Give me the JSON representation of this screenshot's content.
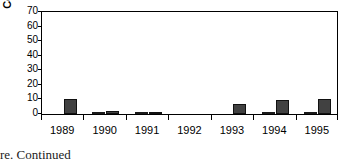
{
  "figure": {
    "caption": "re. Continued"
  },
  "chart_data": {
    "type": "bar",
    "title": "",
    "xlabel": "",
    "ylabel": "Cover (%)",
    "ylim": [
      0,
      70
    ],
    "ytick_values": [
      0,
      10,
      20,
      30,
      40,
      50,
      60,
      70
    ],
    "ytick_labels": [
      "0",
      "10",
      "20",
      "30",
      "40",
      "50",
      "60",
      "70"
    ],
    "grid": false,
    "legend": "none",
    "categories": [
      "1989",
      "1990",
      "1991",
      "1992",
      "1993",
      "1994",
      "1995"
    ],
    "series": [
      {
        "name": "series-light",
        "color": "#ffffff",
        "values": [
          0,
          1.5,
          0.7,
          0,
          0,
          0.5,
          1.0
        ]
      },
      {
        "name": "series-dark",
        "color": "#414141",
        "values": [
          10.0,
          2.0,
          0.3,
          0,
          7.0,
          9.5,
          10.0
        ]
      }
    ]
  }
}
